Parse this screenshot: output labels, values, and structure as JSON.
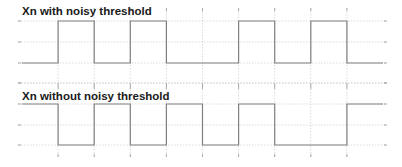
{
  "chart_data": [
    {
      "type": "line",
      "subtype": "step",
      "title": "Xn with noisy threshold",
      "xlabel": "",
      "ylabel": "",
      "grid": true,
      "x_transitions": [
        0,
        1,
        2,
        3,
        4,
        5,
        6,
        7,
        8,
        9,
        10
      ],
      "x_grid_ticks": [
        1,
        2,
        3,
        4,
        5,
        6,
        7,
        8,
        9
      ],
      "levels": [
        "low",
        "high"
      ],
      "segments": [
        {
          "x0": 0,
          "x1": 1,
          "value": 0
        },
        {
          "x0": 1,
          "x1": 2,
          "value": 1
        },
        {
          "x0": 2,
          "x1": 3,
          "value": 0
        },
        {
          "x0": 3,
          "x1": 4,
          "value": 1
        },
        {
          "x0": 4,
          "x1": 6,
          "value": 0
        },
        {
          "x0": 6,
          "x1": 7,
          "value": 1
        },
        {
          "x0": 7,
          "x1": 8,
          "value": 0
        },
        {
          "x0": 8,
          "x1": 9,
          "value": 1
        },
        {
          "x0": 9,
          "x1": 10,
          "value": 0
        }
      ],
      "values": [
        0,
        1,
        0,
        1,
        0,
        0,
        1,
        0,
        1,
        0
      ]
    },
    {
      "type": "line",
      "subtype": "step",
      "title": "Xn without noisy threshold",
      "xlabel": "",
      "ylabel": "",
      "grid": true,
      "x_transitions": [
        0,
        1,
        2,
        3,
        4,
        5,
        6,
        7,
        8,
        9,
        10
      ],
      "x_grid_ticks": [
        1,
        2,
        3,
        4,
        5,
        6,
        7,
        8,
        9
      ],
      "levels": [
        "low",
        "high"
      ],
      "segments": [
        {
          "x0": 0,
          "x1": 1,
          "value": 1
        },
        {
          "x0": 1,
          "x1": 2,
          "value": 0
        },
        {
          "x0": 2,
          "x1": 3,
          "value": 1
        },
        {
          "x0": 3,
          "x1": 4,
          "value": 0
        },
        {
          "x0": 4,
          "x1": 5,
          "value": 1
        },
        {
          "x0": 5,
          "x1": 6,
          "value": 0
        },
        {
          "x0": 6,
          "x1": 7,
          "value": 1
        },
        {
          "x0": 7,
          "x1": 9,
          "value": 0
        },
        {
          "x0": 9,
          "x1": 10,
          "value": 1
        }
      ],
      "values": [
        1,
        0,
        1,
        0,
        1,
        0,
        1,
        0,
        0,
        1
      ]
    }
  ],
  "charts": {
    "top": {
      "title": "Xn with noisy threshold"
    },
    "bottom": {
      "title": "Xn without noisy threshold"
    }
  },
  "colors": {
    "signal": "#808080",
    "grid": "#d0d0d0",
    "title": "#1a1a1a",
    "background": "#ffffff"
  }
}
